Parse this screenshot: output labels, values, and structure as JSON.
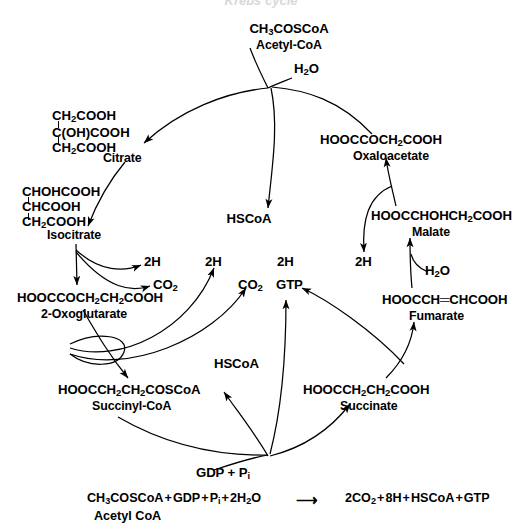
{
  "page": {
    "title_cut_off": "Krebs cycle",
    "width": 522,
    "height": 531,
    "background": "#ffffff",
    "ink": "#000000"
  },
  "diagram": {
    "type": "krebs-tca-cycle",
    "inputs": {
      "acetyl_coa_formula": "CH₃COSCoA",
      "acetyl_coa_name": "Acetyl-CoA",
      "water_top": "H₂O",
      "water_malate": "H₂O",
      "gdp_pi": "GDP + P",
      "gdp_pi_sub": "i"
    },
    "metabolites": [
      {
        "id": "citrate",
        "name": "Citrate",
        "structure_lines": [
          "CH₂COOH",
          "C(OH)COOH",
          "CH₂COOH"
        ]
      },
      {
        "id": "isocitrate",
        "name": "Isocitrate",
        "structure_lines": [
          "CHOHCOOH",
          "CHCOOH",
          "CH₂COOH"
        ]
      },
      {
        "id": "oxoglutarate",
        "name": "2-Oxoglutarate",
        "formula": "HOOCCOCH₂CH₂COOH"
      },
      {
        "id": "succinyl-coa",
        "name": "Succinyl-CoA",
        "formula": "HOOCCH₂CH₂COSCoA"
      },
      {
        "id": "succinate",
        "name": "Succinate",
        "formula": "HOOCCH₂CH₂COOH"
      },
      {
        "id": "fumarate",
        "name": "Fumarate",
        "formula": "HOOCCH═CHCOOH"
      },
      {
        "id": "malate",
        "name": "Malate",
        "formula": "HOOCCHOHCH₂COOH"
      },
      {
        "id": "oxaloacetate",
        "name": "Oxaloacetate",
        "formula": "HOOCCOCH₂COOH"
      }
    ],
    "cofactors": {
      "hscoa_citrate": "HSCoA",
      "hscoa_succinyl": "HSCoA",
      "hydrogen_isocitrate": "2H",
      "hydrogen_oxoglutarate": "2H",
      "hydrogen_succinate": "2H",
      "hydrogen_malate": "2H",
      "co2_isocitrate": "CO₂",
      "co2_oxoglutarate": "CO₂",
      "gtp": "GTP"
    },
    "summary_equation": {
      "left": "CH₃COSCoA + GDP + P",
      "left_sub": "i",
      "left_tail": " + 2H₂O",
      "arrow": "⟶",
      "right": "2CO₂ + 8H + HSCoA + GTP",
      "note": "Acetyl CoA"
    }
  }
}
